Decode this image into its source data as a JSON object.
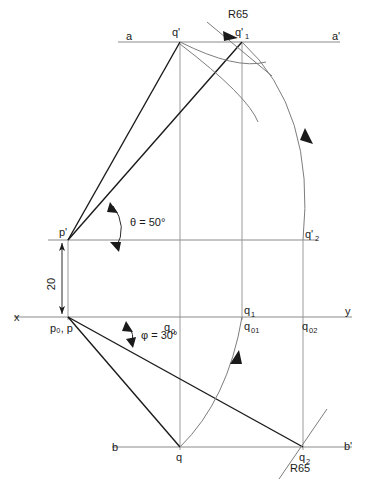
{
  "drawing": {
    "title": "Orthographic projection of line PQ - true length construction",
    "type": "engineering-drawing",
    "canvas": {
      "width": 372,
      "height": 500
    },
    "colors": {
      "reference_line": "#8a8a8a",
      "projection_line": "#9a9a9a",
      "object_line": "#1a1a1a",
      "arc_line": "#7d7d7d",
      "dimension": "#2a2a2a",
      "background": "#ffffff"
    },
    "reference_lines": [
      {
        "name": "a-a'",
        "left_label": "a",
        "right_label": "a'",
        "y": 42,
        "x1": 118,
        "x2": 340
      },
      {
        "name": "xy",
        "left_label": "x",
        "right_label": "y",
        "y": 317,
        "x1": 14,
        "x2": 352
      },
      {
        "name": "b-b'",
        "left_label": "b",
        "right_label": "b'",
        "y": 447,
        "x1": 112,
        "x2": 352
      },
      {
        "name": "p'-horizontal",
        "left_label": "",
        "right_label": "",
        "y": 240,
        "x1": 48,
        "x2": 318
      }
    ],
    "points": [
      {
        "id": "q-prime",
        "label": "q",
        "prime": true,
        "sub": "",
        "x": 180,
        "y": 42
      },
      {
        "id": "q-prime-1",
        "label": "q",
        "prime": true,
        "sub": "1",
        "x": 242,
        "y": 42
      },
      {
        "id": "p-prime",
        "label": "p",
        "prime": true,
        "sub": "",
        "x": 68,
        "y": 240
      },
      {
        "id": "q-prime-2",
        "label": "q",
        "prime": true,
        "sub": "2",
        "x": 303,
        "y": 240
      },
      {
        "id": "p0-p",
        "label": "p₀, p",
        "prime": false,
        "sub": "",
        "x": 68,
        "y": 317
      },
      {
        "id": "q0",
        "label": "q",
        "prime": false,
        "sub": "0",
        "x": 180,
        "y": 317
      },
      {
        "id": "q1",
        "label": "q",
        "prime": false,
        "sub": "1",
        "x": 242,
        "y": 317
      },
      {
        "id": "q01",
        "label": "q",
        "prime": false,
        "sub": "01",
        "x": 242,
        "y": 317
      },
      {
        "id": "q02",
        "label": "q",
        "prime": false,
        "sub": "02",
        "x": 303,
        "y": 317
      },
      {
        "id": "q",
        "label": "q",
        "prime": false,
        "sub": "",
        "x": 180,
        "y": 447
      },
      {
        "id": "q2",
        "label": "q",
        "prime": false,
        "sub": "2",
        "x": 303,
        "y": 447
      }
    ],
    "labels": {
      "a": "a",
      "a_prime": "a'",
      "x": "x",
      "y": "y",
      "b": "b",
      "b_prime": "b'",
      "q_prime": "q'",
      "q_prime_1_base": "q'",
      "q_prime_1_sub": "1",
      "q_prime_2_base": "q'",
      "q_prime_2_sub": "2",
      "p_prime": "p'",
      "p0_p": "p₀, p",
      "q0_base": "q",
      "q0_sub": "0",
      "q1_base": "q",
      "q1_sub": "1",
      "q01_base": "q",
      "q01_sub": "01",
      "q02_base": "q",
      "q02_sub": "02",
      "q": "q",
      "q2_base": "q",
      "q2_sub": "2"
    },
    "annotations": {
      "theta": "θ = 50°",
      "phi": "φ = 30°",
      "dimension_20": "20",
      "radius_top": "R65",
      "radius_bottom": "R65"
    },
    "values": {
      "theta_degrees": 50,
      "phi_degrees": 30,
      "vertical_offset": 20,
      "radius": 65
    },
    "arcs": [
      {
        "name": "arc-q-prime-to-q-prime-2",
        "from": "q'",
        "to": "q'2",
        "center": "p'",
        "radius_label": "R65"
      },
      {
        "name": "arc-q-to-q1",
        "from": "q",
        "to": "q1",
        "center": "p",
        "radius_label": "R65"
      },
      {
        "name": "arc-locus-top",
        "from": "q'1",
        "to": "q'2",
        "radius_label": ""
      },
      {
        "name": "arc-locus-bottom",
        "from": "q",
        "to": "q2",
        "radius_label": "R65"
      }
    ]
  }
}
